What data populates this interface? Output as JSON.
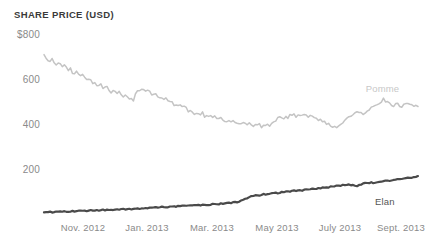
{
  "chart_data": {
    "type": "line",
    "title": "SHARE PRICE (USD)",
    "xlabel": "",
    "ylabel": "SHARE PRICE (USD)",
    "ylim": [
      0,
      800
    ],
    "yticks": [
      800,
      600,
      400,
      200
    ],
    "ytick_labels": [
      "$800",
      "600",
      "400",
      "200"
    ],
    "grid": false,
    "legend_position": "inline-right",
    "xtick_labels": [
      "Nov. 2012",
      "Jan. 2013",
      "Mar. 2013",
      "May 2013",
      "July 2013",
      "Sept. 2013"
    ],
    "x_range_start": "Oct. 2012",
    "x_range_end": "Sept. 2013",
    "series": [
      {
        "name": "Pomme",
        "color": "#c4c4c4",
        "label_x_frac": 0.86,
        "label_y_value": 560,
        "values": [
          705,
          700,
          693,
          688,
          694,
          681,
          672,
          678,
          666,
          659,
          663,
          650,
          641,
          648,
          636,
          628,
          634,
          622,
          615,
          620,
          608,
          600,
          606,
          595,
          588,
          593,
          582,
          575,
          581,
          570,
          563,
          568,
          557,
          550,
          556,
          545,
          538,
          543,
          533,
          526,
          531,
          521,
          514,
          519,
          509,
          537,
          548,
          556,
          562,
          555,
          548,
          553,
          544,
          537,
          541,
          532,
          525,
          528,
          518,
          511,
          515,
          506,
          499,
          503,
          494,
          487,
          491,
          482,
          476,
          480,
          471,
          465,
          469,
          461,
          455,
          459,
          451,
          446,
          450,
          443,
          438,
          442,
          436,
          431,
          435,
          429,
          425,
          428,
          423,
          419,
          422,
          418,
          415,
          418,
          414,
          411,
          414,
          410,
          407,
          410,
          406,
          403,
          406,
          402,
          399,
          401,
          398,
          395,
          398,
          394,
          398,
          402,
          408,
          413,
          420,
          427,
          433,
          428,
          424,
          430,
          436,
          442,
          448,
          443,
          438,
          444,
          450,
          445,
          440,
          446,
          441,
          436,
          441,
          436,
          430,
          426,
          421,
          416,
          411,
          406,
          401,
          396,
          391,
          387,
          392,
          398,
          404,
          410,
          417,
          424,
          430,
          437,
          443,
          450,
          456,
          462,
          457,
          452,
          458,
          464,
          470,
          476,
          482,
          489,
          495,
          502,
          508,
          514,
          509,
          504,
          499,
          494,
          489,
          492,
          496,
          490,
          485,
          489,
          493,
          488,
          492,
          496,
          490,
          486,
          490
        ]
      },
      {
        "name": "Elan",
        "color": "#4a4a4a",
        "label_x_frac": 0.885,
        "label_y_value": 60,
        "values": [
          12,
          12,
          13,
          13,
          13,
          14,
          14,
          14,
          15,
          15,
          15,
          16,
          16,
          16,
          17,
          17,
          17,
          18,
          18,
          18,
          19,
          19,
          19,
          20,
          20,
          20,
          21,
          21,
          21,
          22,
          22,
          22,
          23,
          23,
          24,
          24,
          24,
          25,
          25,
          26,
          26,
          26,
          27,
          27,
          28,
          28,
          29,
          29,
          30,
          30,
          31,
          31,
          32,
          32,
          33,
          33,
          34,
          34,
          35,
          35,
          36,
          36,
          37,
          37,
          38,
          38,
          39,
          39,
          40,
          40,
          41,
          41,
          42,
          42,
          43,
          43,
          44,
          44,
          45,
          45,
          46,
          46,
          47,
          48,
          48,
          49,
          49,
          50,
          51,
          51,
          52,
          53,
          54,
          55,
          56,
          58,
          60,
          63,
          66,
          70,
          74,
          78,
          82,
          85,
          88,
          86,
          88,
          91,
          93,
          92,
          94,
          96,
          95,
          97,
          99,
          98,
          100,
          102,
          101,
          103,
          105,
          104,
          106,
          108,
          107,
          109,
          111,
          110,
          112,
          114,
          113,
          115,
          117,
          116,
          118,
          120,
          119,
          121,
          123,
          122,
          124,
          126,
          125,
          127,
          129,
          128,
          130,
          132,
          131,
          133,
          135,
          134,
          136,
          132,
          130,
          133,
          136,
          139,
          141,
          140,
          142,
          144,
          143,
          145,
          147,
          149,
          148,
          150,
          152,
          154,
          153,
          155,
          157,
          159,
          158,
          160,
          162,
          164,
          163,
          165,
          167,
          166,
          168,
          170,
          172
        ]
      }
    ]
  }
}
